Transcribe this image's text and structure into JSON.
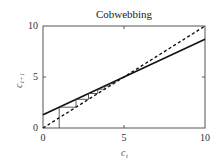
{
  "chart_data": {
    "type": "line",
    "title": "Cobwebbing",
    "xlabel": "c_t",
    "ylabel": "c_{t+1}",
    "xlim": [
      0,
      10
    ],
    "ylim": [
      0,
      10
    ],
    "xticks": [
      0,
      5,
      10
    ],
    "yticks": [
      0,
      5,
      10
    ],
    "grid": false,
    "series": [
      {
        "name": "map",
        "style": "solid",
        "x": [
          0,
          10
        ],
        "y": [
          1.3,
          8.7
        ]
      },
      {
        "name": "identity",
        "style": "dashed",
        "x": [
          0,
          10
        ],
        "y": [
          0,
          10
        ]
      },
      {
        "name": "cobweb",
        "style": "thin-solid",
        "start": 1.0,
        "points": [
          [
            1,
            0
          ],
          [
            1,
            2.04
          ],
          [
            2.04,
            2.04
          ],
          [
            2.04,
            2.81
          ],
          [
            2.81,
            2.81
          ],
          [
            2.81,
            3.38
          ],
          [
            3.38,
            3.38
          ],
          [
            3.38,
            3.8
          ],
          [
            3.8,
            3.8
          ],
          [
            3.8,
            4.11
          ],
          [
            4.11,
            4.11
          ],
          [
            4.11,
            4.34
          ],
          [
            4.34,
            4.34
          ],
          [
            4.34,
            4.51
          ],
          [
            4.51,
            4.51
          ]
        ]
      }
    ]
  },
  "title": "Cobwebbing",
  "labels": {
    "x": "c",
    "x_sub": "t",
    "y": "c",
    "y_sub": "t+1"
  },
  "ticks": {
    "x0": "0",
    "x5": "5",
    "x10": "10",
    "y0": "0",
    "y5": "5",
    "y10": "10"
  }
}
